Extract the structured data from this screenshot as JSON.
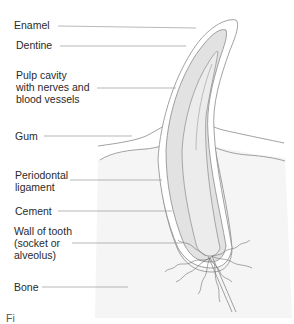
{
  "diagram": {
    "labels": [
      {
        "id": "enamel",
        "text": "Enamel"
      },
      {
        "id": "dentine",
        "text": "Dentine"
      },
      {
        "id": "pulp",
        "text": "Pulp cavity\nwith nerves and\nblood vessels"
      },
      {
        "id": "gum",
        "text": "Gum"
      },
      {
        "id": "periodontal",
        "text": "Periodontal\nligament"
      },
      {
        "id": "cement",
        "text": "Cement"
      },
      {
        "id": "wall",
        "text": "Wall of tooth\n(socket or\nalveolus)"
      },
      {
        "id": "bone",
        "text": "Bone"
      }
    ],
    "caption": "Fi"
  },
  "colors": {
    "line": "#8a8a8a",
    "leader": "#9a9a9a",
    "dentine_fill": "#e2e2e2",
    "pulp_fill": "#ececec",
    "bone_fill": "#f4f4f4",
    "text": "#2a2a2a"
  }
}
